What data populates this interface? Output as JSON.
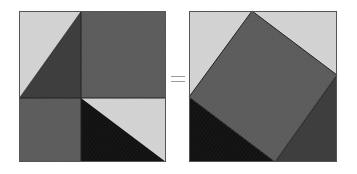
{
  "diagram": {
    "operator": "=",
    "colors": {
      "light": "#d2d2d2",
      "medium": "#5b5b5b",
      "dark": "#3c3c3c",
      "black": "#111111",
      "border": "#555555",
      "equals": "#9a9a9a"
    },
    "left_panel": {
      "description": "Square a+b split into a^2, b^2 and four triangles",
      "square": {
        "x": 19,
        "y": 11,
        "size": 147
      },
      "split": {
        "x": 81,
        "y": 98
      },
      "regions": [
        {
          "name": "top-left-light-triangle",
          "fill": "light"
        },
        {
          "name": "top-left-dark-triangle",
          "fill": "dark"
        },
        {
          "name": "top-right-square",
          "fill": "medium"
        },
        {
          "name": "bottom-left-square",
          "fill": "medium"
        },
        {
          "name": "bottom-right-light-triangle",
          "fill": "light"
        },
        {
          "name": "bottom-right-black-triangle",
          "fill": "black"
        }
      ]
    },
    "right_panel": {
      "description": "Same square containing tilted c^2 and four triangles",
      "square": {
        "x": 189,
        "y": 11,
        "size": 148
      },
      "tilted_square_vertices": [
        [
          252,
          11
        ],
        [
          337,
          75
        ],
        [
          275,
          162
        ],
        [
          189,
          97
        ]
      ]
    }
  }
}
